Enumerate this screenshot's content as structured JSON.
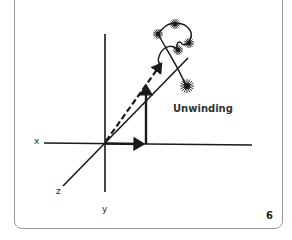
{
  "diagram": {
    "annotation": "Unwinding",
    "page_number": "6",
    "axes": {
      "x_label": "x",
      "y_label": "y",
      "z_label": "z"
    },
    "elements": [
      "x-axis",
      "y-axis",
      "z-axis",
      "x-component-arrow",
      "vertical-component-arrow",
      "dashed-resultant-arrow",
      "solid-diagonal-arrow",
      "unwinding-loop",
      "starbursts"
    ],
    "colors": {
      "stroke": "#1a1a1a",
      "frame": "#9a9a9a",
      "background": "#ffffff"
    }
  }
}
